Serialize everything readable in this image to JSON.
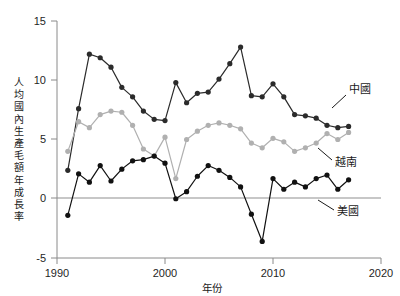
{
  "chart_data": {
    "type": "line",
    "title": "",
    "xlabel": "年份",
    "ylabel": "人均國內生產毛額年成長率",
    "xlim": [
      1990,
      2020
    ],
    "ylim": [
      -5,
      15
    ],
    "xticks": [
      1990,
      2000,
      2010,
      2020
    ],
    "yticks": [
      -5,
      0,
      5,
      10,
      15
    ],
    "grid": false,
    "legend_position": "inline-right-annotations",
    "zero_reference_line": 0,
    "x": [
      1991,
      1992,
      1993,
      1994,
      1995,
      1996,
      1997,
      1998,
      1999,
      2000,
      2001,
      2002,
      2003,
      2004,
      2005,
      2006,
      2007,
      2008,
      2009,
      2010,
      2011,
      2012,
      2013,
      2014,
      2015,
      2016,
      2017
    ],
    "series": [
      {
        "name": "中國",
        "color": "#2b2b2b",
        "values": [
          2.4,
          7.6,
          12.2,
          11.9,
          11.1,
          9.4,
          8.6,
          7.4,
          6.7,
          6.6,
          9.8,
          8.1,
          8.9,
          9.0,
          10.1,
          11.4,
          12.8,
          8.7,
          8.6,
          9.7,
          8.6,
          7.1,
          7.0,
          6.8,
          6.2,
          6.0,
          6.1
        ]
      },
      {
        "name": "越南",
        "color": "#b0b0b0",
        "values": [
          4.0,
          6.5,
          6.0,
          7.1,
          7.4,
          7.3,
          6.2,
          4.2,
          3.6,
          5.2,
          1.7,
          5.0,
          5.7,
          6.2,
          6.4,
          6.2,
          5.9,
          4.7,
          4.3,
          5.1,
          4.8,
          4.0,
          4.3,
          4.7,
          5.5,
          5.0,
          5.6
        ]
      },
      {
        "name": "美國",
        "color": "#111111",
        "values": [
          -1.4,
          2.1,
          1.4,
          2.8,
          1.5,
          2.5,
          3.2,
          3.3,
          3.6,
          3.0,
          0.0,
          0.6,
          1.9,
          2.8,
          2.4,
          1.8,
          1.0,
          -1.3,
          -3.6,
          1.7,
          0.8,
          1.4,
          1.0,
          1.7,
          2.0,
          0.8,
          1.6
        ]
      }
    ]
  },
  "axis": {
    "y_title_chars": [
      "人",
      "均",
      "國",
      "內",
      "生",
      "產",
      "毛",
      "額",
      "年",
      "成",
      "長",
      "率"
    ],
    "x_title": "年份",
    "ytick_labels": [
      "15",
      "10",
      "5",
      "0",
      "-5"
    ],
    "xtick_labels": [
      "1990",
      "2000",
      "2010",
      "2020"
    ]
  },
  "annotations": [
    {
      "id": "china",
      "label": "中國"
    },
    {
      "id": "vietnam",
      "label": "越南"
    },
    {
      "id": "usa",
      "label": "美國"
    }
  ]
}
